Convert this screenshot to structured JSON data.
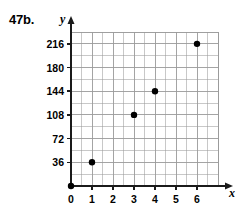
{
  "figure": {
    "problem_label": "47b."
  },
  "chart_data": {
    "type": "scatter",
    "title": "",
    "xlabel": "x",
    "ylabel": "y",
    "x": [
      0,
      1,
      3,
      4,
      6
    ],
    "values": [
      0,
      36,
      108,
      144,
      216
    ],
    "points": [
      {
        "x": 0,
        "y": 0
      },
      {
        "x": 1,
        "y": 36
      },
      {
        "x": 3,
        "y": 108
      },
      {
        "x": 4,
        "y": 144
      },
      {
        "x": 6,
        "y": 216
      }
    ],
    "xlim": [
      0,
      7
    ],
    "ylim": [
      0,
      234
    ],
    "xticks": [
      0,
      1,
      2,
      3,
      4,
      5,
      6
    ],
    "xtick_labels": [
      "0",
      "1",
      "2",
      "3",
      "4",
      "5",
      "6"
    ],
    "yticks": [
      36,
      72,
      108,
      144,
      180,
      216
    ],
    "ytick_labels": [
      "36",
      "72",
      "108",
      "144",
      "180",
      "216"
    ],
    "x_minor_step": 0.5,
    "y_minor_step": 18,
    "grid": true,
    "legend": null,
    "point_color": "#000000",
    "grid_color": "#9a9a9a",
    "axis_color": "#1a1a1a"
  }
}
